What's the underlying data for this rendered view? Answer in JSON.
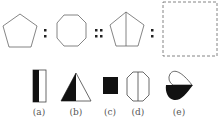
{
  "question": {
    "analogy": [
      "pentagon",
      "octagon",
      "pentagon-with-vertical-line",
      "?"
    ],
    "separators": [
      ":",
      "::",
      ":"
    ]
  },
  "options": [
    {
      "label": "(a)",
      "shape": "rectangle-half-filled-left"
    },
    {
      "label": "(b)",
      "shape": "triangle-half-filled-left"
    },
    {
      "label": "(c)",
      "shape": "filled-square"
    },
    {
      "label": "(d)",
      "shape": "octagon-with-vertical-line"
    },
    {
      "label": "(e)",
      "shape": "teardrop-half-filled-bottom"
    }
  ],
  "colors": {
    "stroke": "#555555",
    "fill": "#111111"
  }
}
